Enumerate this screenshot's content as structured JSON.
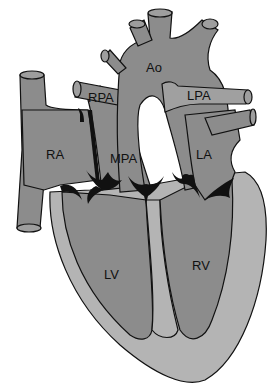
{
  "diagram": {
    "colors": {
      "chamber": "#8c8c8c",
      "myocardium": "#b4b4b4",
      "outline": "#111111",
      "background": "#ffffff"
    },
    "labels": {
      "ao": "Ao",
      "rpa": "RPA",
      "lpa": "LPA",
      "ra": "RA",
      "mpa": "MPA",
      "la": "LA",
      "lv": "LV",
      "rv": "RV"
    }
  }
}
